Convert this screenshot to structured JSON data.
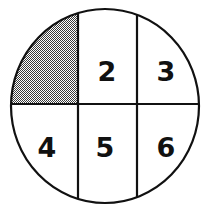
{
  "figure": {
    "name": "circle-divided-into-six-regions",
    "background_color": "#ffffff",
    "stroke_color": "#111111",
    "shade_color": "#808080",
    "shade_pattern": "checkerboard-50-percent",
    "circle": {
      "center_x": 105,
      "center_y": 106,
      "radius_x": 94,
      "radius_y": 97,
      "stroke_width": 2.2
    },
    "dividers": {
      "horizontal_y": 104,
      "vertical_x_1": 78,
      "vertical_x_2": 137,
      "stroke_width": 2.2
    },
    "regions": [
      {
        "id": "region-1",
        "label": "",
        "shaded": true,
        "label_x": 44,
        "label_y": 56
      },
      {
        "id": "region-2",
        "label": "2",
        "shaded": false,
        "label_x": 107,
        "label_y": 72
      },
      {
        "id": "region-3",
        "label": "3",
        "shaded": false,
        "label_x": 166,
        "label_y": 72
      },
      {
        "id": "region-4",
        "label": "4",
        "shaded": false,
        "label_x": 47,
        "label_y": 148
      },
      {
        "id": "region-5",
        "label": "5",
        "shaded": false,
        "label_x": 105,
        "label_y": 148
      },
      {
        "id": "region-6",
        "label": "6",
        "shaded": false,
        "label_x": 166,
        "label_y": 148
      }
    ]
  }
}
